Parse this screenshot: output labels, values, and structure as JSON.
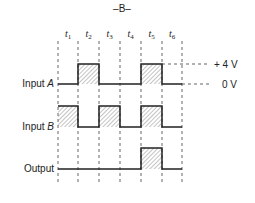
{
  "figure_label": "–B–",
  "time_labels": [
    "t1",
    "t2",
    "t3",
    "t4",
    "t5",
    "t6"
  ],
  "time_label_display": [
    {
      "t": "t",
      "sub": "1"
    },
    {
      "t": "t",
      "sub": "2"
    },
    {
      "t": "t",
      "sub": "3"
    },
    {
      "t": "t",
      "sub": "4"
    },
    {
      "t": "t",
      "sub": "5"
    },
    {
      "t": "t",
      "sub": "6"
    }
  ],
  "voltage_labels": {
    "high": "+ 4 V",
    "low": "0 V"
  },
  "signals": [
    {
      "name": "Input A",
      "label_main": "Input ",
      "label_var": "A",
      "levels": [
        0,
        1,
        0,
        0,
        1,
        0
      ]
    },
    {
      "name": "Input B",
      "label_main": "Input ",
      "label_var": "B",
      "levels": [
        1,
        0,
        1,
        0,
        1,
        0
      ]
    },
    {
      "name": "Output",
      "label_main": "Output",
      "label_var": "",
      "levels": [
        0,
        0,
        0,
        0,
        1,
        0
      ]
    }
  ],
  "colors": {
    "ink": "#222222",
    "hatch": "#888888"
  }
}
